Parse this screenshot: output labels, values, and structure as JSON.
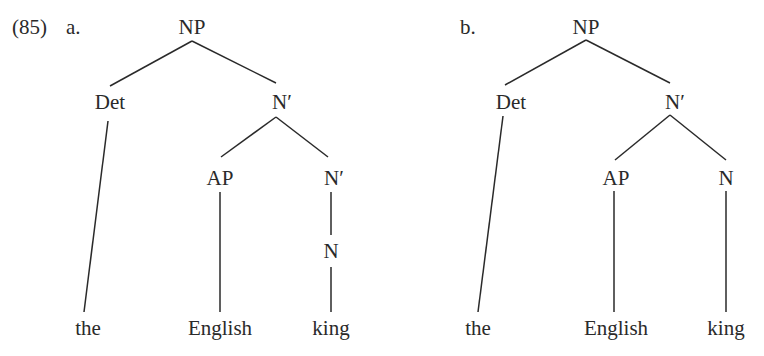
{
  "example_number": "(85)",
  "trees": [
    {
      "label": "a.",
      "nodes": {
        "root": "NP",
        "det": "Det",
        "nbar1": "N′",
        "ap": "AP",
        "nbar2": "N′",
        "n": "N"
      },
      "leaves": {
        "the": "the",
        "english": "English",
        "king": "king"
      },
      "structure": "[NP [Det the] [N′ [AP English] [N′ [N king]]]]"
    },
    {
      "label": "b.",
      "nodes": {
        "root": "NP",
        "det": "Det",
        "nbar1": "N′",
        "ap": "AP",
        "n": "N"
      },
      "leaves": {
        "the": "the",
        "english": "English",
        "king": "king"
      },
      "structure": "[NP [Det the] [N′ [AP English] [N king]]]"
    }
  ]
}
